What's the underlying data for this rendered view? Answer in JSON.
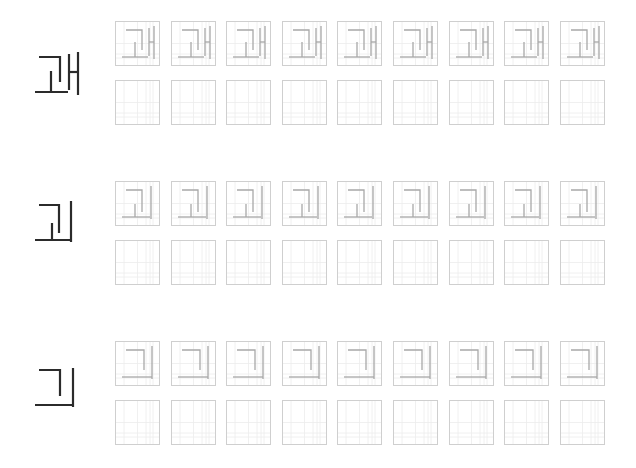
{
  "worksheet": {
    "title": "Korean handwriting practice",
    "colors": {
      "model_glyph": "#2b2b2b",
      "trace_glyph": "#a8a8a8",
      "box_border": "#cfcfcf",
      "guide_line": "#ececec"
    },
    "boxes_per_row": 9,
    "blocks": [
      {
        "character": "괘",
        "jamo": [
          "ㄱ",
          "ㅗ",
          "ㅐ"
        ],
        "top": 20,
        "trace_row_label": "trace row",
        "practice_row_label": "blank practice row"
      },
      {
        "character": "괴",
        "jamo": [
          "ㄱ",
          "ㅗ",
          "ㅣ"
        ],
        "top": 180,
        "trace_row_label": "trace row",
        "practice_row_label": "blank practice row"
      },
      {
        "character": "긔",
        "jamo": [
          "ㄱ",
          "ㅡ",
          "ㅣ"
        ],
        "top": 340,
        "trace_row_label": "trace row",
        "practice_row_label": "blank practice row"
      }
    ]
  }
}
